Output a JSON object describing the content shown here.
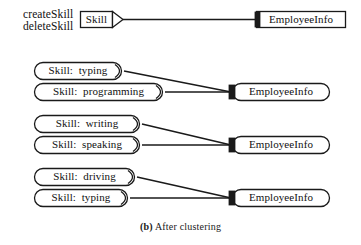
{
  "figure": {
    "caption_prefix": "(b)",
    "caption_text": "After clustering",
    "background_color": "#ffffff",
    "line_color": "#1a1a1a",
    "text_color": "#111111"
  },
  "operations": {
    "line1": "createSkill",
    "line2": "deleteSkill"
  },
  "groups": [
    {
      "id": "group-original",
      "shape": "rectangle",
      "providers": [
        {
          "label": "Skill",
          "shape": "rectangle-with-point"
        }
      ],
      "consumer": {
        "label": "EmployeeInfo",
        "shape": "rectangle"
      }
    },
    {
      "id": "group-cluster-1",
      "shape": "rounded",
      "providers": [
        {
          "label": "Skill:  typing",
          "shape": "rounded-with-point"
        },
        {
          "label": "Skill:  programming",
          "shape": "rounded-with-point"
        }
      ],
      "consumer": {
        "label": "EmployeeInfo",
        "shape": "rounded"
      }
    },
    {
      "id": "group-cluster-2",
      "shape": "rounded",
      "providers": [
        {
          "label": "Skill:  writing",
          "shape": "rounded-with-point"
        },
        {
          "label": "Skill:  speaking",
          "shape": "rounded-with-point"
        }
      ],
      "consumer": {
        "label": "EmployeeInfo",
        "shape": "rounded"
      }
    },
    {
      "id": "group-cluster-3",
      "shape": "rounded",
      "providers": [
        {
          "label": "Skill:  driving",
          "shape": "rounded-with-point"
        },
        {
          "label": "Skill:  typing",
          "shape": "rounded-with-point"
        }
      ],
      "consumer": {
        "label": "EmployeeInfo",
        "shape": "rounded"
      }
    }
  ]
}
